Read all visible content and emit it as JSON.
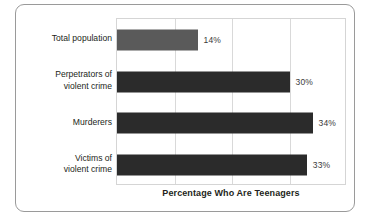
{
  "chart_data": {
    "type": "bar",
    "orientation": "horizontal",
    "title": "",
    "xlabel": "Percentage Who Are Teenagers",
    "ylabel": "",
    "categories": [
      "Total population",
      "Perpetrators of violent crime",
      "Murderers",
      "Victims of violent crime"
    ],
    "values": [
      14,
      30,
      34,
      33
    ],
    "value_labels": [
      "14%",
      "30%",
      "34%",
      "33%"
    ],
    "xlim": [
      0,
      40
    ],
    "xticks": [
      0,
      10,
      20,
      30,
      40
    ],
    "grid": "vertical",
    "legend": "none",
    "bar_colors": [
      "#5a5a5a",
      "#2b2b2b",
      "#2b2b2b",
      "#2b2b2b"
    ]
  },
  "categories": [
    {
      "line1": "Total population",
      "line2": ""
    },
    {
      "line1": "Perpetrators of",
      "line2": "violent crime"
    },
    {
      "line1": "Murderers",
      "line2": ""
    },
    {
      "line1": "Victims of",
      "line2": "violent crime"
    }
  ],
  "axis": {
    "title": "Percentage Who Are Teenagers"
  },
  "colors": {
    "bar_light": "#5a5a5a",
    "bar_dark": "#2b2b2b",
    "gridline": "#d9d9d9",
    "plot_border": "#d5d5d5",
    "figure_border": "#9a9a9a",
    "text": "#231f20",
    "value_text": "#3a3a3a",
    "background": "#ffffff"
  }
}
